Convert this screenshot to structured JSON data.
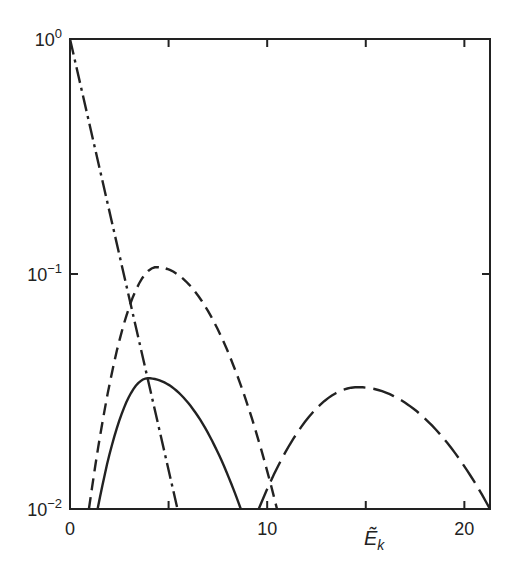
{
  "chart_data": {
    "type": "line",
    "title": "",
    "xlabel": "Ẽ",
    "xlabel_sub": "k",
    "ylabel": "",
    "xlim": [
      0,
      21.3
    ],
    "ylim": [
      0.01,
      1
    ],
    "yscale": "log",
    "grid": false,
    "x_ticks": [
      0,
      5,
      10,
      15,
      20
    ],
    "x_tick_labels": [
      {
        "value": 0,
        "label": "0"
      },
      {
        "value": 10,
        "label": "10"
      },
      {
        "value": 20,
        "label": "20"
      }
    ],
    "y_tick_labels": [
      {
        "value": 1,
        "base": "10",
        "exp": "0"
      },
      {
        "value": 0.1,
        "base": "10",
        "exp": "−1"
      },
      {
        "value": 0.01,
        "base": "10",
        "exp": "−2"
      }
    ],
    "series": [
      {
        "name": "dash-dot",
        "style": "dashdot",
        "x": [
          0,
          5.45
        ],
        "y": [
          1,
          0.01
        ]
      },
      {
        "name": "dashed",
        "style": "dashed",
        "peak": [
          4.4,
          0.107
        ],
        "start": 0.96,
        "end": 10.5
      },
      {
        "name": "solid",
        "style": "solid",
        "peak": [
          3.95,
          0.036
        ],
        "start": 1.4,
        "end": 8.66
      },
      {
        "name": "long-dash",
        "style": "longdash",
        "peak": [
          14.6,
          0.033
        ],
        "start": 9.57,
        "end": 21.3
      }
    ]
  }
}
